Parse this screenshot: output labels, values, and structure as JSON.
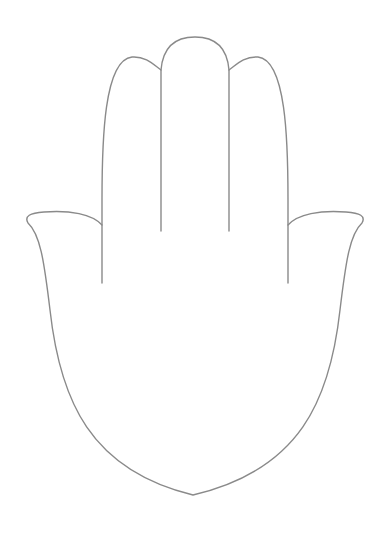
{
  "figure": {
    "stroke_color": "#8a8a8a",
    "background": "#ffffff"
  }
}
